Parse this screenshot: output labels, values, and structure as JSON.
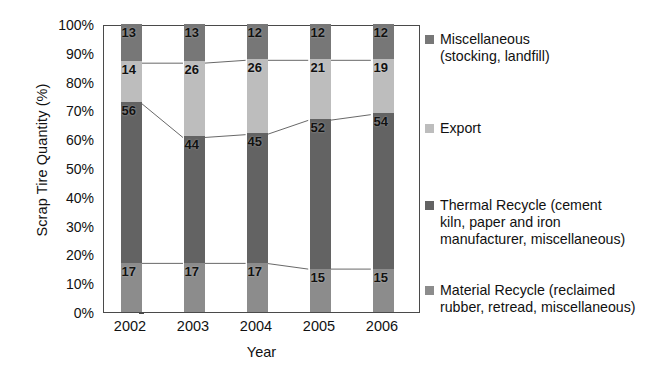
{
  "chart_data": {
    "type": "bar",
    "subtype": "stacked-100-percent",
    "title": "",
    "xlabel": "Year",
    "ylabel": "Scrap Tire Quantity (%)",
    "categories": [
      "2002",
      "2003",
      "2004",
      "2005",
      "2006"
    ],
    "ylim": [
      0,
      100
    ],
    "ytick_labels": [
      "100%",
      "90%",
      "80%",
      "70%",
      "60%",
      "50%",
      "40%",
      "30%",
      "20%",
      "10%",
      "0%"
    ],
    "ytick_values": [
      100,
      90,
      80,
      70,
      60,
      50,
      40,
      30,
      20,
      10,
      0
    ],
    "grid": false,
    "legend_position": "right",
    "connector_lines": true,
    "series": [
      {
        "name": "Material Recycle (reclaimed\nrubber, retread, miscellaneous)",
        "short_name": "Material Recycle",
        "color": "#8c8c8c",
        "values": [
          17,
          17,
          17,
          15,
          15
        ],
        "labels": [
          "17",
          "17",
          "17",
          "15",
          "15"
        ]
      },
      {
        "name": "Thermal Recycle (cement\nkiln, paper and iron\nmanufacturer, miscellaneous)",
        "short_name": "Thermal Recycle",
        "color": "#636363",
        "values": [
          56,
          44,
          45,
          52,
          54
        ],
        "labels": [
          "56",
          "44",
          "45",
          "52",
          "54"
        ]
      },
      {
        "name": "Export",
        "short_name": "Export",
        "color": "#bdbdbd",
        "values": [
          14,
          26,
          26,
          21,
          19
        ],
        "labels": [
          "14",
          "26",
          "26",
          "21",
          "19"
        ]
      },
      {
        "name": "Miscellaneous\n(stocking, landfill)",
        "short_name": "Miscellaneous",
        "color": "#777777",
        "values": [
          13,
          13,
          12,
          12,
          12
        ],
        "labels": [
          "13",
          "13",
          "12",
          "12",
          "12"
        ]
      }
    ]
  },
  "axis": {
    "y_title": "Scrap Tire Quantity (%)",
    "x_title": "Year",
    "axis_color": "#4a4a4a"
  },
  "legend": {
    "items": [
      {
        "label": "Miscellaneous\n(stocking, landfill)",
        "color": "#777777"
      },
      {
        "label": "Export",
        "color": "#bdbdbd"
      },
      {
        "label": "Thermal Recycle (cement\nkiln, paper and iron\nmanufacturer, miscellaneous)",
        "color": "#636363"
      },
      {
        "label": "Material Recycle (reclaimed\nrubber, retread, miscellaneous)",
        "color": "#8c8c8c"
      }
    ],
    "item_tops": [
      6,
      95,
      172,
      257
    ]
  }
}
